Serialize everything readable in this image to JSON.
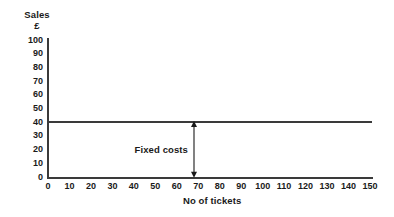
{
  "chart_data": {
    "type": "line",
    "title": "",
    "subtitle": "",
    "xlabel": "No of tickets",
    "ylabel": "Sales",
    "ylabel_unit": "£",
    "xlim": [
      0,
      150
    ],
    "ylim": [
      0,
      100
    ],
    "grid": false,
    "legend": false,
    "x_ticks": [
      0,
      10,
      20,
      30,
      40,
      50,
      60,
      70,
      80,
      90,
      100,
      110,
      120,
      130,
      140,
      150
    ],
    "y_ticks": [
      0,
      10,
      20,
      30,
      40,
      50,
      60,
      70,
      80,
      90,
      100
    ],
    "x_tick_labels": [
      "0",
      "10",
      "20",
      "30",
      "40",
      "50",
      "60",
      "70",
      "80",
      "90",
      "100",
      "110",
      "120",
      "130",
      "140",
      "150"
    ],
    "y_tick_labels": [
      "0",
      "10",
      "20",
      "30",
      "40",
      "50",
      "60",
      "70",
      "80",
      "90",
      "100"
    ],
    "series": [
      {
        "name": "Fixed costs",
        "type": "line",
        "color": "#3a3a3a",
        "constant_value": 40,
        "x": [
          0,
          150
        ],
        "values": [
          40,
          40
        ]
      }
    ],
    "annotations": [
      {
        "label": "Fixed costs",
        "kind": "double-headed-arrow",
        "x": 68,
        "y_from": 0,
        "y_to": 40,
        "color": "#1a1a1a"
      }
    ]
  },
  "axes": {
    "y_title_line1": "Sales",
    "y_title_line2": "£",
    "x_title": "No of tickets"
  },
  "colors": {
    "ink": "#1a1a1a",
    "axis": "#3a3a3a",
    "series": "#3a3a3a",
    "background": "#ffffff"
  }
}
